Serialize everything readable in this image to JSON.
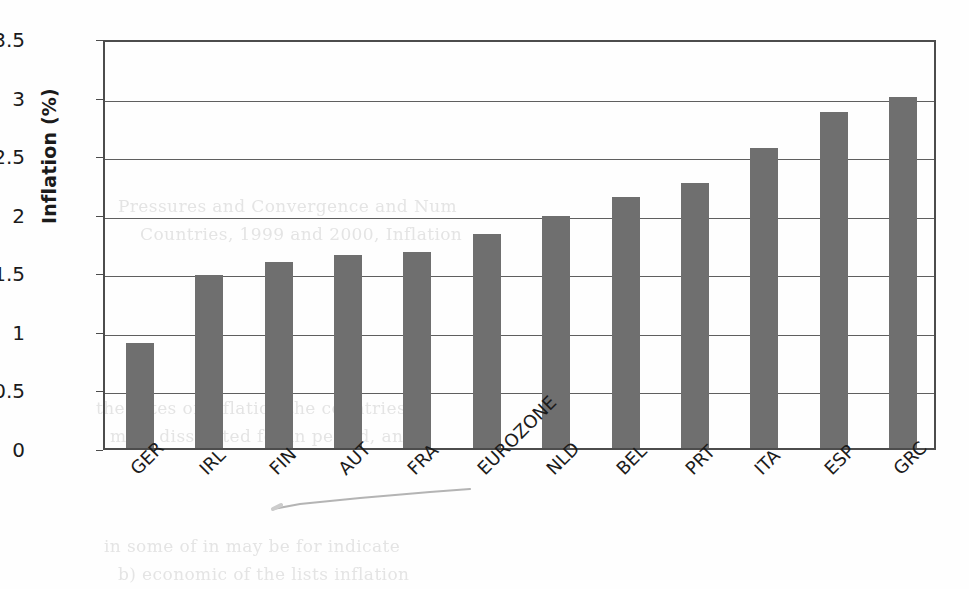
{
  "chart_data": {
    "type": "bar",
    "title": "",
    "xlabel": "",
    "ylabel": "Inflation (%)",
    "categories": [
      "GER",
      "IRL",
      "FIN",
      "AUT",
      "FRA",
      "EUROZONE",
      "NLD",
      "BEL",
      "PRT",
      "ITA",
      "ESP",
      "GRC"
    ],
    "values": [
      0.9,
      1.48,
      1.59,
      1.65,
      1.67,
      1.83,
      1.98,
      2.14,
      2.26,
      2.56,
      2.87,
      3.0
    ],
    "ylim": [
      0,
      3.5
    ],
    "yticks": [
      "0",
      "0.5",
      "1",
      "1.5",
      "2",
      "2.5",
      "3",
      "3.5"
    ],
    "ytick_values": [
      0,
      0.5,
      1,
      1.5,
      2,
      2.5,
      3,
      3.5
    ],
    "grid": true,
    "legend": false,
    "bar_color": "#6f6f6f",
    "frame_color": "#4c4c4c",
    "text_color": "#1b1b1b",
    "background": "#fefefe"
  },
  "artifacts": {
    "ghost_text": [
      {
        "text": "Pressures and Convergence and Num",
        "x": 118,
        "y": 196
      },
      {
        "text": "Countries,  1999  and 2000, Inflation",
        "x": 140,
        "y": 224
      },
      {
        "text": "the rates of inflation  the countries",
        "x": 96,
        "y": 398
      },
      {
        "text": "most dissipated  for  in period, and",
        "x": 110,
        "y": 426
      },
      {
        "text": "in some  of  in  may  be  for  indicate",
        "x": 104,
        "y": 536
      },
      {
        "text": "b) economic  of  the  lists  inflation",
        "x": 118,
        "y": 564
      }
    ],
    "scan_line": {
      "name": "stray-scan-line"
    }
  }
}
